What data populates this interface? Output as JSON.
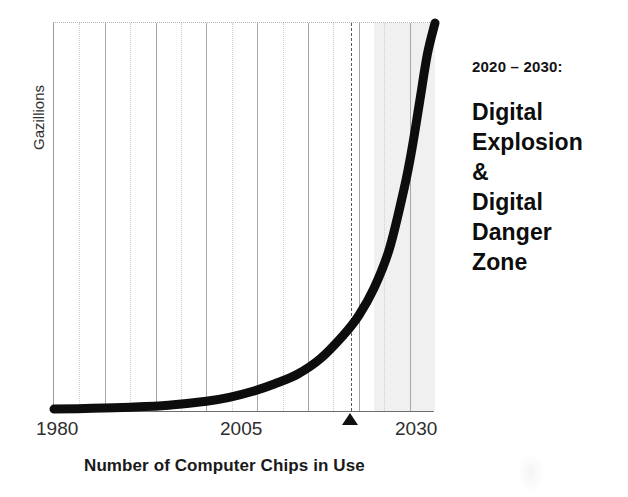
{
  "chart_data": {
    "type": "line",
    "title": "",
    "xlabel": "Number of Computer Chips in Use",
    "ylabel": "Gazillions",
    "xticks": [
      "1980",
      "2005",
      "2030"
    ],
    "xlim": [
      1980,
      2030
    ],
    "ylim": [
      0,
      100
    ],
    "grid": true,
    "legend": "none",
    "series": [
      {
        "name": "Computer chips in use",
        "x": [
          1980,
          1985,
          1990,
          1995,
          2000,
          2003,
          2006,
          2009,
          2012,
          2015,
          2018,
          2020,
          2022,
          2024,
          2026,
          2027,
          2028,
          2029,
          2030
        ],
        "y": [
          1,
          1.2,
          1.5,
          2,
          3,
          4,
          5.5,
          7.5,
          10,
          14,
          20,
          25,
          32,
          42,
          58,
          68,
          80,
          92,
          100
        ]
      }
    ],
    "annotations": [
      {
        "name": "danger-zone-band",
        "type": "vspan",
        "x_start": 2022,
        "x_end": 2030,
        "color": "#f0f0f0"
      },
      {
        "name": "marker-year",
        "type": "vline-with-triangle",
        "x": 2019,
        "style": "dashed"
      }
    ]
  },
  "axis": {
    "y_title": "Gazillions",
    "x_title": "Number of Computer Chips in Use",
    "x_tick_labels": [
      "1980",
      "2005",
      "2030"
    ]
  },
  "annotation": {
    "period": "2020 – 2030:",
    "lines": [
      "Digital",
      "Explosion",
      "&",
      "Digital",
      "Danger",
      "Zone"
    ]
  },
  "colors": {
    "curve": "#0d0d0d",
    "grid_solid": "#a6a6a6",
    "grid_faint": "#cfcfcf",
    "danger_band": "#f0f0f0",
    "text": "#1a1a1a",
    "background": "#ffffff"
  },
  "icons": {
    "marker": "up-triangle-marker"
  }
}
